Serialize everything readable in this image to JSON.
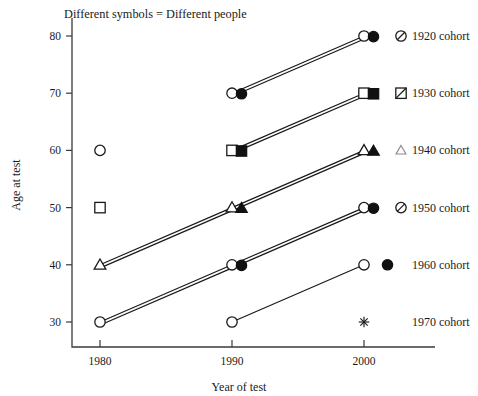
{
  "chart_data": {
    "type": "line",
    "title": "",
    "annotation": "Different symbols = Different people",
    "xlabel": "Year of test",
    "ylabel": "Age at test",
    "xlim": [
      1975,
      2004
    ],
    "ylim": [
      26,
      84
    ],
    "xticks": [
      1980,
      1990,
      2000
    ],
    "xticklabels": [
      "1980",
      "1990",
      "2000"
    ],
    "yticks": [
      30,
      40,
      50,
      60,
      70,
      80
    ],
    "yticklabels": [
      "30",
      "40",
      "50",
      "60",
      "70",
      "80"
    ],
    "grid": false,
    "legend_position": "right",
    "note_position": "top-left",
    "series": [
      {
        "name": "1920 cohort",
        "label": "1920 cohort",
        "label_age": 80,
        "x": [
          1990,
          2000
        ],
        "y": [
          70,
          80
        ],
        "lines": 2,
        "markers": [
          "open-circle",
          "filled-circle"
        ],
        "legend_symbols": [
          "open-circle",
          "filled-circle",
          "slashed-circle"
        ]
      },
      {
        "name": "1930 cohort",
        "label": "1930 cohort",
        "label_age": 70,
        "x": [
          1990,
          2000
        ],
        "y": [
          60,
          70
        ],
        "lines": 2,
        "markers": [
          "open-square",
          "filled-square"
        ],
        "legend_symbols": [
          "open-square",
          "filled-square",
          "slashed-square"
        ]
      },
      {
        "name": "1940 cohort",
        "label": "1940 cohort",
        "label_age": 60,
        "x": [
          1980,
          1990,
          2000
        ],
        "y": [
          40,
          50,
          60
        ],
        "lines": 2,
        "markers": [
          "open-triangle",
          "filled-triangle"
        ],
        "legend_symbols": [
          "open-triangle",
          "filled-triangle",
          "light-triangle"
        ]
      },
      {
        "name": "1950 cohort",
        "label": "1950 cohort",
        "label_age": 50,
        "x": [
          1980,
          1990,
          2000
        ],
        "y": [
          30,
          40,
          50
        ],
        "lines": 2,
        "markers": [
          "open-circle",
          "filled-circle"
        ],
        "legend_symbols": [
          "open-circle",
          "filled-circle",
          "slashed-circle"
        ]
      },
      {
        "name": "1960 cohort",
        "label": "1960 cohort",
        "label_age": 40,
        "x": [
          1990,
          2000
        ],
        "y": [
          30,
          40
        ],
        "lines": 1,
        "markers": [
          "open-circle"
        ],
        "legend_symbols": [
          "open-circle",
          "filled-circle"
        ]
      },
      {
        "name": "1970 cohort",
        "label": "1970 cohort",
        "label_age": 30,
        "x": [],
        "y": [],
        "lines": 0,
        "markers": [],
        "legend_symbols": [
          "star"
        ]
      }
    ],
    "plotted_points": [
      {
        "year": 1980,
        "age": 60,
        "symbol": "open-circle",
        "cohort": "1920 cohort"
      },
      {
        "year": 1990,
        "age": 70,
        "symbol": "open-circle",
        "cohort": "1920 cohort"
      },
      {
        "year": 1990,
        "age": 70,
        "symbol": "filled-circle",
        "cohort": "1920 cohort"
      },
      {
        "year": 2000,
        "age": 80,
        "symbol": "open-circle",
        "cohort": "1920 cohort"
      },
      {
        "year": 2000,
        "age": 80,
        "symbol": "filled-circle",
        "cohort": "1920 cohort"
      },
      {
        "year": 1980,
        "age": 50,
        "symbol": "open-square",
        "cohort": "1930 cohort"
      },
      {
        "year": 1990,
        "age": 60,
        "symbol": "open-square",
        "cohort": "1930 cohort"
      },
      {
        "year": 1990,
        "age": 60,
        "symbol": "filled-square",
        "cohort": "1930 cohort"
      },
      {
        "year": 2000,
        "age": 70,
        "symbol": "open-square",
        "cohort": "1930 cohort"
      },
      {
        "year": 2000,
        "age": 70,
        "symbol": "filled-square",
        "cohort": "1930 cohort"
      },
      {
        "year": 1980,
        "age": 40,
        "symbol": "open-triangle",
        "cohort": "1940 cohort"
      },
      {
        "year": 1990,
        "age": 50,
        "symbol": "open-triangle",
        "cohort": "1940 cohort"
      },
      {
        "year": 1990,
        "age": 50,
        "symbol": "filled-triangle",
        "cohort": "1940 cohort"
      },
      {
        "year": 2000,
        "age": 60,
        "symbol": "open-triangle",
        "cohort": "1940 cohort"
      },
      {
        "year": 2000,
        "age": 60,
        "symbol": "filled-triangle",
        "cohort": "1940 cohort"
      },
      {
        "year": 1980,
        "age": 30,
        "symbol": "open-circle",
        "cohort": "1950 cohort"
      },
      {
        "year": 1990,
        "age": 40,
        "symbol": "open-circle",
        "cohort": "1950 cohort"
      },
      {
        "year": 1990,
        "age": 40,
        "symbol": "filled-circle",
        "cohort": "1950 cohort"
      },
      {
        "year": 2000,
        "age": 50,
        "symbol": "open-circle",
        "cohort": "1950 cohort"
      },
      {
        "year": 2000,
        "age": 50,
        "symbol": "filled-circle",
        "cohort": "1950 cohort"
      },
      {
        "year": 1990,
        "age": 30,
        "symbol": "open-circle",
        "cohort": "1960 cohort"
      },
      {
        "year": 2000,
        "age": 40,
        "symbol": "open-circle",
        "cohort": "1960 cohort"
      },
      {
        "year": 2000,
        "age": 30,
        "symbol": "star",
        "cohort": "1970 cohort"
      }
    ]
  }
}
